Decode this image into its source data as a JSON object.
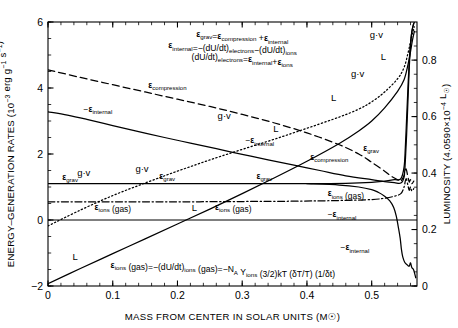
{
  "chart_data": {
    "type": "line",
    "title": "",
    "xlabel": "MASS FROM CENTER IN SOLAR UNITS (M☉)",
    "ylabel": "ENERGY–GENERATION RATES (10⁻³ erg g⁻¹ s⁻¹)",
    "ylabel_right": "LUMINOSITY (4.0590×10⁻⁴ L☉)",
    "xlim": [
      0,
      0.57
    ],
    "ylim": [
      -2,
      6
    ],
    "ylim_right": [
      0,
      0.935
    ],
    "xticks": [
      0,
      0.1,
      0.2,
      0.3,
      0.4,
      0.5
    ],
    "xticklabels": [
      "0",
      "0.1",
      "0.2",
      "0.3",
      "0.4",
      "0.5"
    ],
    "yticks": [
      -2,
      0,
      2,
      4,
      6
    ],
    "yticklabels": [
      "−2",
      "0",
      "2",
      "4",
      "6"
    ],
    "yticks_right": [
      0,
      0.2,
      0.4,
      0.6,
      0.8
    ],
    "yticklabels_right": [
      "0",
      "0.2",
      "0.4",
      "0.6",
      "0.8"
    ],
    "grid": false,
    "legend": "inline-curve-labels",
    "series": [
      {
        "name": "ε_compression",
        "style": "dashed",
        "points": [
          [
            0.0,
            4.55
          ],
          [
            0.05,
            4.32
          ],
          [
            0.1,
            4.1
          ],
          [
            0.15,
            3.88
          ],
          [
            0.2,
            3.66
          ],
          [
            0.25,
            3.44
          ],
          [
            0.3,
            3.2
          ],
          [
            0.35,
            2.94
          ],
          [
            0.4,
            2.64
          ],
          [
            0.45,
            2.28
          ],
          [
            0.48,
            2.0
          ],
          [
            0.5,
            1.75
          ],
          [
            0.52,
            1.48
          ],
          [
            0.53,
            1.33
          ],
          [
            0.54,
            1.22
          ],
          [
            0.545,
            1.18
          ],
          [
            0.55,
            1.35
          ],
          [
            0.553,
            1.55
          ],
          [
            0.556,
            1.3
          ],
          [
            0.558,
            1.15
          ],
          [
            0.56,
            1.22
          ],
          [
            0.562,
            1.1
          ],
          [
            0.565,
            1.18
          ]
        ]
      },
      {
        "name": "−ε_internal",
        "style": "solid",
        "points": [
          [
            0.0,
            3.28
          ],
          [
            0.03,
            3.18
          ],
          [
            0.06,
            3.05
          ],
          [
            0.1,
            2.86
          ],
          [
            0.14,
            2.68
          ],
          [
            0.18,
            2.5
          ],
          [
            0.22,
            2.33
          ],
          [
            0.26,
            2.16
          ],
          [
            0.3,
            1.99
          ],
          [
            0.34,
            1.82
          ],
          [
            0.38,
            1.66
          ],
          [
            0.42,
            1.5
          ],
          [
            0.46,
            1.34
          ],
          [
            0.5,
            1.22
          ],
          [
            0.52,
            1.16
          ],
          [
            0.535,
            1.13
          ],
          [
            0.545,
            1.12
          ],
          [
            0.55,
            1.3
          ],
          [
            0.552,
            1.8
          ],
          [
            0.554,
            2.6
          ],
          [
            0.556,
            3.6
          ],
          [
            0.558,
            4.6
          ],
          [
            0.56,
            5.3
          ],
          [
            0.562,
            5.7
          ],
          [
            0.564,
            5.9
          ],
          [
            0.566,
            6.0
          ]
        ]
      },
      {
        "name": "ε_grav",
        "style": "solid",
        "points": [
          [
            0.0,
            1.1
          ],
          [
            0.1,
            1.1
          ],
          [
            0.2,
            1.1
          ],
          [
            0.3,
            1.1
          ],
          [
            0.4,
            1.1
          ],
          [
            0.46,
            1.11
          ],
          [
            0.5,
            1.14
          ],
          [
            0.52,
            1.18
          ],
          [
            0.535,
            1.22
          ],
          [
            0.545,
            1.25
          ],
          [
            0.55,
            1.6
          ],
          [
            0.552,
            2.2
          ],
          [
            0.554,
            3.1
          ],
          [
            0.556,
            4.0
          ],
          [
            0.558,
            4.8
          ],
          [
            0.56,
            5.35
          ],
          [
            0.562,
            5.7
          ],
          [
            0.565,
            5.95
          ]
        ]
      },
      {
        "name": "ε_ions (gas)",
        "style": "dashdot",
        "points": [
          [
            0.0,
            0.55
          ],
          [
            0.1,
            0.55
          ],
          [
            0.2,
            0.55
          ],
          [
            0.3,
            0.56
          ],
          [
            0.38,
            0.57
          ],
          [
            0.45,
            0.59
          ],
          [
            0.5,
            0.62
          ],
          [
            0.52,
            0.66
          ],
          [
            0.535,
            0.72
          ],
          [
            0.545,
            0.8
          ],
          [
            0.55,
            1.0
          ],
          [
            0.553,
            1.25
          ],
          [
            0.556,
            1.05
          ],
          [
            0.558,
            0.9
          ],
          [
            0.56,
            1.0
          ],
          [
            0.562,
            0.88
          ],
          [
            0.565,
            0.95
          ]
        ]
      },
      {
        "name": "g·v",
        "style": "dotted",
        "points": [
          [
            0.0,
            -0.18
          ],
          [
            0.05,
            0.3
          ],
          [
            0.1,
            0.74
          ],
          [
            0.15,
            1.12
          ],
          [
            0.2,
            1.48
          ],
          [
            0.25,
            1.82
          ],
          [
            0.3,
            2.14
          ],
          [
            0.35,
            2.45
          ],
          [
            0.4,
            2.78
          ],
          [
            0.45,
            3.12
          ],
          [
            0.48,
            3.36
          ],
          [
            0.5,
            3.58
          ],
          [
            0.52,
            3.88
          ],
          [
            0.54,
            4.28
          ],
          [
            0.55,
            4.62
          ],
          [
            0.556,
            5.05
          ],
          [
            0.56,
            5.4
          ],
          [
            0.563,
            5.66
          ],
          [
            0.566,
            5.85
          ]
        ]
      },
      {
        "name": "L",
        "style": "solid",
        "points": [
          [
            0.0,
            -1.93
          ],
          [
            0.05,
            -1.47
          ],
          [
            0.1,
            -1.02
          ],
          [
            0.15,
            -0.57
          ],
          [
            0.2,
            -0.12
          ],
          [
            0.25,
            0.33
          ],
          [
            0.3,
            0.8
          ],
          [
            0.35,
            1.28
          ],
          [
            0.4,
            1.78
          ],
          [
            0.45,
            2.32
          ],
          [
            0.48,
            2.7
          ],
          [
            0.5,
            3.0
          ],
          [
            0.52,
            3.4
          ],
          [
            0.54,
            3.9
          ],
          [
            0.55,
            4.25
          ],
          [
            0.556,
            4.7
          ],
          [
            0.56,
            5.1
          ],
          [
            0.563,
            5.45
          ],
          [
            0.566,
            5.72
          ]
        ]
      },
      {
        "name": "−ε_internal (lower branch)",
        "style": "solid",
        "points": [
          [
            0.4,
            1.1
          ],
          [
            0.45,
            1.06
          ],
          [
            0.48,
            1.0
          ],
          [
            0.5,
            0.92
          ],
          [
            0.51,
            0.84
          ],
          [
            0.52,
            0.72
          ],
          [
            0.528,
            0.58
          ],
          [
            0.534,
            0.38
          ],
          [
            0.538,
            0.12
          ],
          [
            0.541,
            -0.2
          ],
          [
            0.544,
            -0.55
          ],
          [
            0.546,
            -0.9
          ],
          [
            0.548,
            -1.12
          ],
          [
            0.551,
            -1.28
          ],
          [
            0.555,
            -1.36
          ],
          [
            0.558,
            -1.4
          ],
          [
            0.56,
            -1.3
          ],
          [
            0.562,
            -1.44
          ],
          [
            0.565,
            -1.52
          ],
          [
            0.568,
            -1.75
          ]
        ]
      }
    ],
    "reference_lines": [
      {
        "name": "zero-line",
        "y": 0,
        "style": "solid"
      }
    ],
    "annotations": [
      {
        "text": "εgrav=εcompression +εinternal",
        "x": 0.3,
        "y": 5.55
      },
      {
        "text": "εinternal=−(dU/dt)electrons−(dU/dt)ions",
        "x": 0.285,
        "y": 5.2
      },
      {
        "text": "(dU/dt)electrons=εinternal+εions",
        "x": 0.3,
        "y": 4.85
      },
      {
        "text": "εions (gas)=−(dU/dt)ions (gas)=−NA Yions (3/2)kT (δT/T) (1/δt)",
        "x": 0.27,
        "y": -1.45
      }
    ],
    "curve_labels": [
      {
        "text": "εcompression",
        "x": 0.155,
        "y": 4.0
      },
      {
        "text": "−εinternal",
        "x": 0.055,
        "y": 3.28
      },
      {
        "text": "−εinternal",
        "x": 0.305,
        "y": 2.32
      },
      {
        "text": "εcompression",
        "x": 0.405,
        "y": 1.82
      },
      {
        "text": "g·v",
        "x": 0.045,
        "y": 1.34
      },
      {
        "text": "g·v",
        "x": 0.135,
        "y": 1.46
      },
      {
        "text": "g·v",
        "x": 0.262,
        "y": 3.05
      },
      {
        "text": "g·v",
        "x": 0.468,
        "y": 4.34
      },
      {
        "text": "g·v",
        "x": 0.497,
        "y": 5.52
      },
      {
        "text": "εgrav",
        "x": 0.022,
        "y": 1.22
      },
      {
        "text": "εgrav",
        "x": 0.172,
        "y": 1.24
      },
      {
        "text": "εgrav",
        "x": 0.322,
        "y": 1.24
      },
      {
        "text": "εgrav",
        "x": 0.487,
        "y": 2.1
      },
      {
        "text": "εions (gas)",
        "x": 0.072,
        "y": 0.3
      },
      {
        "text": "εions (gas)",
        "x": 0.258,
        "y": 0.3
      },
      {
        "text": "εions (gas)",
        "x": 0.432,
        "y": 0.72
      },
      {
        "text": "−εinternal",
        "x": 0.432,
        "y": 0.08
      },
      {
        "text": "−εinternal",
        "x": 0.452,
        "y": -0.92
      },
      {
        "text": "L",
        "x": 0.038,
        "y": -1.2
      },
      {
        "text": "L",
        "x": 0.222,
        "y": 0.28
      },
      {
        "text": "L",
        "x": 0.348,
        "y": 2.66
      },
      {
        "text": "L",
        "x": 0.437,
        "y": 3.62
      },
      {
        "text": "L",
        "x": 0.514,
        "y": 4.86
      }
    ]
  },
  "axes": {
    "x_title": "MASS FROM CENTER IN SOLAR UNITS (M☉)",
    "y_left_title_main": "ENERGY–GENERATION RATES (10",
    "y_left_title_exp": "−3",
    "y_left_title_tail": " erg g",
    "y_left_exp2": "−1",
    "y_left_tail2": " s",
    "y_left_exp3": "−1",
    "y_left_close": ")",
    "y_right_title_a": "LUMINOSITY (4.0590×10",
    "y_right_exp": "−4",
    "y_right_title_b": " L",
    "y_right_sun": "☉",
    "y_right_close": ")"
  },
  "equations": {
    "eq1": {
      "p1": "ε",
      "s1": "grav",
      "p2": "=ε",
      "s2": "compression",
      "p3": " +ε",
      "s3": "internal"
    },
    "eq2": {
      "p1": "ε",
      "s1": "internal",
      "p2": "=−(dU/dt)",
      "s2": "electrons",
      "p3": "−(dU/dt)",
      "s3": "ions"
    },
    "eq3": {
      "p1": "(dU/dt)",
      "s1": "electrons",
      "p2": "=ε",
      "s2": "internal",
      "p3": "+ε",
      "s3": "ions"
    },
    "eq4": {
      "p1": "ε",
      "s1": "ions",
      "p2": " (gas)=−(dU/dt)",
      "s2": "ions",
      "p3": " (gas)=−N",
      "s3": "A",
      "p4": " Y",
      "s4": "ions",
      "p5": " (3/2)kT (δT/T) (1/δt)"
    }
  },
  "colors": {
    "ink": "#000000",
    "background": "#ffffff"
  }
}
